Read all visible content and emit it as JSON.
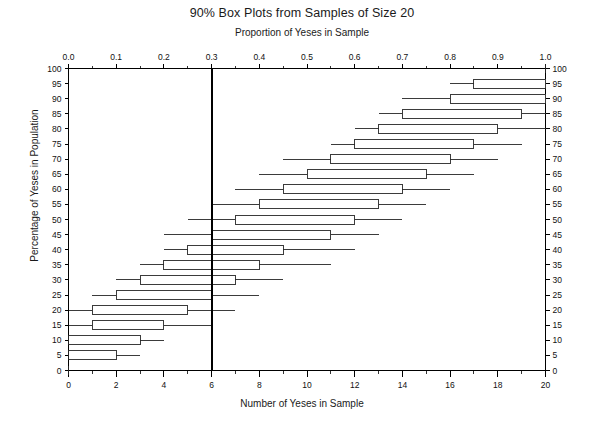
{
  "chart_data": {
    "type": "box",
    "title": "90% Box Plots from Samples of Size 20",
    "subtitle": "Proportion of Yeses in Sample",
    "xlabel": "Number of Yeses in Sample",
    "ylabel": "Percentage of Yeses in Population",
    "xlim": [
      0,
      20
    ],
    "ylim": [
      0,
      100
    ],
    "grid": false,
    "legend": null,
    "top_axis": {
      "label": "Proportion of Yeses in Sample",
      "lim": [
        0.0,
        1.0
      ],
      "tick_labels": [
        "0.0",
        "0.1",
        "0.2",
        "0.3",
        "0.4",
        "0.5",
        "0.6",
        "0.7",
        "0.8",
        "0.9",
        "1.0"
      ],
      "tick_values": [
        0.0,
        0.1,
        0.2,
        0.3,
        0.4,
        0.5,
        0.6,
        0.7,
        0.8,
        0.9,
        1.0
      ],
      "minor_tick_step": 0.05
    },
    "bottom_axis": {
      "label": "Number of Yeses in Sample",
      "lim": [
        0,
        20
      ],
      "tick_labels": [
        "0",
        "2",
        "4",
        "6",
        "8",
        "10",
        "12",
        "14",
        "16",
        "18",
        "20"
      ],
      "tick_values": [
        0,
        2,
        4,
        6,
        8,
        10,
        12,
        14,
        16,
        18,
        20
      ],
      "minor_tick_step": 1
    },
    "left_axis": {
      "label": "Percentage of Yeses in Population",
      "lim": [
        0,
        100
      ],
      "tick_labels": [
        "0",
        "5",
        "10",
        "15",
        "20",
        "25",
        "30",
        "35",
        "40",
        "45",
        "50",
        "55",
        "60",
        "65",
        "70",
        "75",
        "80",
        "85",
        "90",
        "95",
        "100"
      ],
      "tick_values": [
        0,
        5,
        10,
        15,
        20,
        25,
        30,
        35,
        40,
        45,
        50,
        55,
        60,
        65,
        70,
        75,
        80,
        85,
        90,
        95,
        100
      ]
    },
    "right_axis": {
      "lim": [
        0,
        100
      ],
      "tick_labels": [
        "0",
        "5",
        "10",
        "15",
        "20",
        "25",
        "30",
        "35",
        "40",
        "45",
        "50",
        "55",
        "60",
        "65",
        "70",
        "75",
        "80",
        "85",
        "90",
        "95",
        "100"
      ],
      "tick_values": [
        0,
        5,
        10,
        15,
        20,
        25,
        30,
        35,
        40,
        45,
        50,
        55,
        60,
        65,
        70,
        75,
        80,
        85,
        90,
        95,
        100
      ]
    },
    "reference_line": {
      "orientation": "vertical",
      "value": 6,
      "proportion": 0.3,
      "color": "#000000"
    },
    "boxes": [
      {
        "p": 0,
        "whisker_low": 0,
        "q1": 0,
        "q3": 0,
        "whisker_high": 0
      },
      {
        "p": 5,
        "whisker_low": 0,
        "q1": 0,
        "q3": 2,
        "whisker_high": 3
      },
      {
        "p": 10,
        "whisker_low": 0,
        "q1": 0,
        "q3": 3,
        "whisker_high": 4
      },
      {
        "p": 15,
        "whisker_low": 0,
        "q1": 1,
        "q3": 4,
        "whisker_high": 6
      },
      {
        "p": 20,
        "whisker_low": 0,
        "q1": 1,
        "q3": 5,
        "whisker_high": 7
      },
      {
        "p": 25,
        "whisker_low": 1,
        "q1": 2,
        "q3": 6,
        "whisker_high": 8
      },
      {
        "p": 30,
        "whisker_low": 2,
        "q1": 3,
        "q3": 7,
        "whisker_high": 9
      },
      {
        "p": 35,
        "whisker_low": 3,
        "q1": 4,
        "q3": 8,
        "whisker_high": 11
      },
      {
        "p": 40,
        "whisker_low": 4,
        "q1": 5,
        "q3": 9,
        "whisker_high": 12
      },
      {
        "p": 45,
        "whisker_low": 4,
        "q1": 6,
        "q3": 11,
        "whisker_high": 13
      },
      {
        "p": 50,
        "whisker_low": 5,
        "q1": 7,
        "q3": 12,
        "whisker_high": 14
      },
      {
        "p": 55,
        "whisker_low": 6,
        "q1": 8,
        "q3": 13,
        "whisker_high": 15
      },
      {
        "p": 60,
        "whisker_low": 7,
        "q1": 9,
        "q3": 14,
        "whisker_high": 16
      },
      {
        "p": 65,
        "whisker_low": 8,
        "q1": 10,
        "q3": 15,
        "whisker_high": 17
      },
      {
        "p": 70,
        "whisker_low": 9,
        "q1": 11,
        "q3": 16,
        "whisker_high": 18
      },
      {
        "p": 75,
        "whisker_low": 11,
        "q1": 12,
        "q3": 17,
        "whisker_high": 19
      },
      {
        "p": 80,
        "whisker_low": 12,
        "q1": 13,
        "q3": 18,
        "whisker_high": 20
      },
      {
        "p": 85,
        "whisker_low": 13,
        "q1": 14,
        "q3": 19,
        "whisker_high": 20
      },
      {
        "p": 90,
        "whisker_low": 14,
        "q1": 16,
        "q3": 20,
        "whisker_high": 20
      },
      {
        "p": 95,
        "whisker_low": 16,
        "q1": 17,
        "q3": 20,
        "whisker_high": 20
      },
      {
        "p": 100,
        "whisker_low": 20,
        "q1": 20,
        "q3": 20,
        "whisker_high": 20
      }
    ]
  }
}
